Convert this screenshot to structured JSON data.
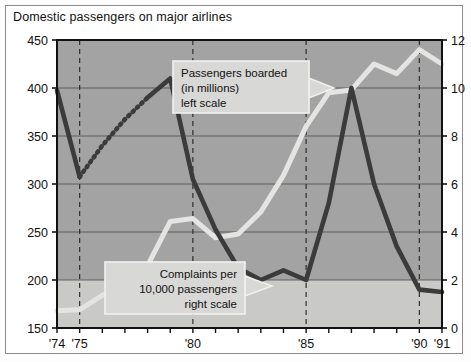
{
  "figure": {
    "title": "Domestic passengers on major airlines"
  },
  "chart_data": {
    "type": "line",
    "title": "Domestic passengers on major airlines",
    "xlabel": "",
    "grid": true,
    "legend_position": "inline-callouts",
    "x": [
      1974,
      1975,
      1976,
      1977,
      1978,
      1979,
      1980,
      1981,
      1982,
      1983,
      1984,
      1985,
      1986,
      1987,
      1988,
      1989,
      1990,
      1991
    ],
    "xlim": [
      1974,
      1991
    ],
    "xtick_labels": [
      "'74",
      "'75",
      "'80",
      "'85",
      "'90",
      "'91"
    ],
    "xtick_values": [
      1974,
      1975,
      1980,
      1985,
      1990,
      1991
    ],
    "xminor_every": 1,
    "vertical_marker_years": [
      1975,
      1980,
      1985,
      1990
    ],
    "axes": [
      {
        "id": "left",
        "label": "Passengers boarded (in millions)",
        "ylim": [
          150,
          450
        ],
        "yticks": [
          150,
          200,
          250,
          300,
          350,
          400,
          450
        ]
      },
      {
        "id": "right",
        "label": "Complaints per 10,000 passengers",
        "ylim": [
          0,
          12
        ],
        "yticks": [
          0,
          2,
          4,
          6,
          8,
          10,
          12
        ]
      }
    ],
    "series": [
      {
        "name": "Passengers boarded (in millions)",
        "axis": "left",
        "color": "#e4e4e2",
        "style": "solid",
        "values": [
          168,
          169,
          184,
          195,
          215,
          261,
          264,
          244,
          248,
          271,
          309,
          360,
          395,
          398,
          425,
          415,
          440,
          425
        ]
      },
      {
        "name": "Complaints per 10,000 passengers",
        "axis": "right",
        "color": "#3b3b3b",
        "style": "solid-with-dotted-gap",
        "dotted_segment_years": [
          1976,
          1977
        ],
        "values": [
          9.9,
          6.3,
          7.6,
          8.7,
          9.6,
          10.4,
          6.2,
          4.1,
          2.5,
          2.0,
          2.4,
          2.0,
          5.2,
          10.0,
          6.0,
          3.4,
          1.6,
          1.5
        ]
      }
    ],
    "annotations": [
      {
        "id": "passengers-callout",
        "lines": [
          "Passengers boarded",
          "(in millions)",
          "left scale"
        ],
        "align": "left",
        "points_to": "passengers-series"
      },
      {
        "id": "complaints-callout",
        "lines": [
          "Complaints per",
          "10,000 passengers",
          "right scale"
        ],
        "align": "right",
        "points_to": "complaints-series"
      }
    ],
    "colors": {
      "plot_background": "#a3a3a3",
      "plot_background_lower_band": "#c9c9c7",
      "gridline": "#4a4a4a",
      "marker_line": "#2f2f2f",
      "frame": "#8a8a8a",
      "callout_fill": "#d8d8d6",
      "callout_border": "#f2f2f0"
    }
  }
}
